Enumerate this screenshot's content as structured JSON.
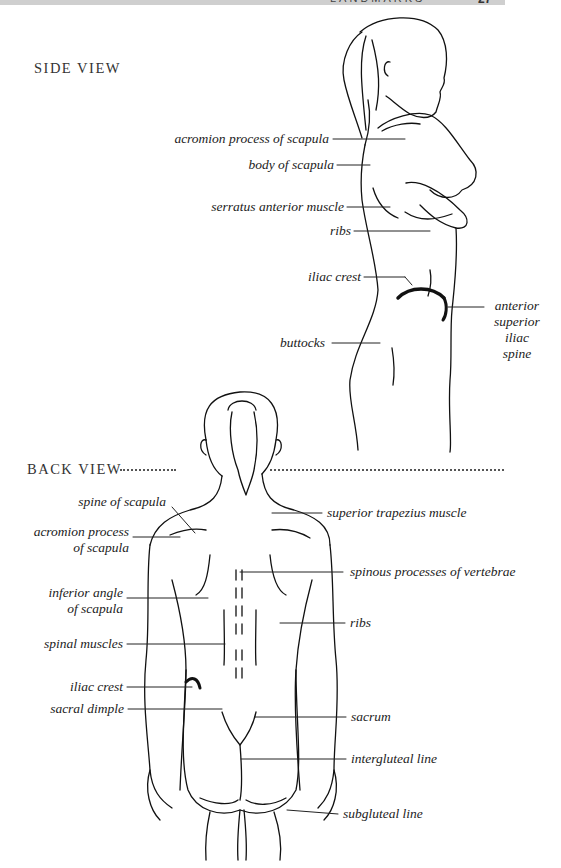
{
  "header": {
    "title": "LANDMARKS",
    "page_number": "27"
  },
  "side_view": {
    "title": "SIDE VIEW",
    "labels": [
      "acromion process of scapula",
      "body of scapula",
      "serratus anterior muscle",
      "ribs",
      "iliac crest",
      "buttocks",
      "anterior superior iliac spine"
    ],
    "asis_lines": [
      "anterior",
      "superior",
      "iliac",
      "spine"
    ]
  },
  "back_view": {
    "title": "BACK VIEW",
    "left_labels": {
      "spine_of_scapula": "spine of scapula",
      "acromion_1": "acromion process",
      "acromion_2": "of scapula",
      "inferior_angle_1": "inferior angle",
      "inferior_angle_2": "of scapula",
      "spinal_muscles": "spinal muscles",
      "iliac_crest": "iliac crest",
      "sacral_dimple": "sacral dimple"
    },
    "right_labels": {
      "superior_trapezius": "superior trapezius muscle",
      "spinous_processes": "spinous processes of vertebrae",
      "ribs": "ribs",
      "sacrum": "sacrum",
      "intergluteal_line": "intergluteal line",
      "subgluteal_line": "subgluteal line"
    }
  }
}
